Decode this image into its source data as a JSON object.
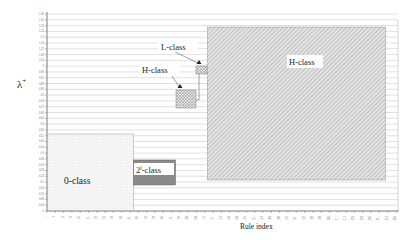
{
  "chart_data": {
    "type": "region-map",
    "title": "",
    "xlabel": "Rule index",
    "ylabel": "λ+",
    "x_ticks": [
      "1",
      "7",
      "13",
      "19",
      "25",
      "31",
      "37",
      "43",
      "49",
      "55",
      "61",
      "67",
      "73",
      "79",
      "85",
      "91",
      "97",
      "103",
      "109",
      "115",
      "121",
      "127",
      "133",
      "139",
      "145",
      "151",
      "157",
      "163",
      "169",
      "175",
      "181",
      "187",
      "193",
      "199",
      "205",
      "211",
      "217",
      "223",
      "229",
      "235",
      "241",
      "247",
      "253"
    ],
    "y_ticks": [
      "0",
      "0.04",
      "0.08",
      "0.12",
      "0.16",
      "0.2",
      "0.24",
      "0.28",
      "0.32",
      "0.36",
      "0.4",
      "0.44",
      "0.48",
      "0.52",
      "0.56",
      "0.6",
      "0.64",
      "0.68",
      "0.72",
      "0.76",
      "0.8",
      "0.84",
      "0.88",
      "0.92",
      "0.96",
      "1",
      "1.04",
      "1.08",
      "1.12",
      "1.16",
      "1.2",
      "1.24",
      "1.28",
      "1.32",
      "1.36"
    ],
    "grid": {
      "horizontal": true,
      "vertical": false
    },
    "regions": [
      {
        "name": "0-class",
        "label": "0-class",
        "x_range": [
          1,
          66
        ],
        "y_range": [
          0,
          1.0
        ],
        "fill": "dotted-light"
      },
      {
        "name": "2l-class",
        "label": "2",
        "label_sup": "l",
        "label_suffix": "-class",
        "x_range": [
          67,
          96
        ],
        "y_range": [
          0.64,
          1.0
        ],
        "fill": "dark-gray"
      },
      {
        "name": "h-class-small",
        "label": "H-class",
        "x_range": [
          97,
          112
        ],
        "y_range": [
          1.12,
          1.2
        ],
        "fill": "crosshatch"
      },
      {
        "name": "l-class",
        "label": "L-class",
        "x_range": [
          113,
          120
        ],
        "y_range": [
          1.24,
          1.28
        ],
        "fill": "crosshatch-light"
      },
      {
        "name": "h-class-large",
        "label": "H-class",
        "x_range": [
          121,
          255
        ],
        "y_range": [
          0.4,
          1.32
        ],
        "fill": "diagonal-hatch"
      }
    ],
    "ylim": [
      0,
      1.36
    ],
    "xlim": [
      1,
      256
    ]
  },
  "labels": {
    "xlabel": "Rule index",
    "ylabel_main": "λ",
    "ylabel_sup": "+",
    "zero_class": "0-class",
    "two_base": "2",
    "two_sup": "l",
    "two_suffix": "-class",
    "h_small": "H-class",
    "l_class": "L-class",
    "h_large": "H-class"
  }
}
